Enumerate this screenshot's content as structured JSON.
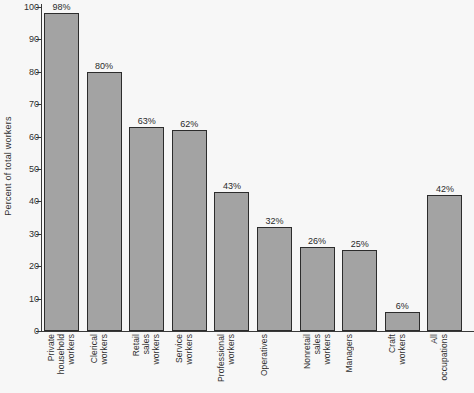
{
  "chart_data": {
    "type": "bar",
    "title": "",
    "xlabel": "",
    "ylabel": "Percent of total workers",
    "ylim": [
      0,
      100
    ],
    "ytick_step": 10,
    "yticks": [
      0,
      10,
      20,
      30,
      40,
      50,
      60,
      70,
      80,
      90,
      100
    ],
    "grid": false,
    "legend": null,
    "bar_color": "#a3a3a3",
    "bar_edge_color": "#2c2c2c",
    "background_color": "#f7f7f7",
    "value_suffix": "%",
    "categories": [
      "Private household workers",
      "Clerical workers",
      "Retail sales workers",
      "Service workers",
      "Professional workers",
      "Operatives",
      "Nonretail sales workers",
      "Managers",
      "Craft workers",
      "All occupations"
    ],
    "category_lines": [
      [
        "Private",
        "household",
        "workers"
      ],
      [
        "Clerical",
        "workers"
      ],
      [
        "Retail",
        "sales",
        "workers"
      ],
      [
        "Service",
        "workers"
      ],
      [
        "Professional",
        "workers"
      ],
      [
        "Operatives"
      ],
      [
        "Nonretail",
        "sales",
        "workers"
      ],
      [
        "Managers"
      ],
      [
        "Craft",
        "workers"
      ],
      [
        "All",
        "occupations"
      ]
    ],
    "values": [
      98,
      80,
      63,
      62,
      43,
      32,
      26,
      25,
      6,
      42
    ],
    "value_labels": [
      "98%",
      "80%",
      "63%",
      "62%",
      "43%",
      "32%",
      "26%",
      "25%",
      "6%",
      "42%"
    ],
    "ytick_labels": [
      "0",
      "10",
      "20",
      "30",
      "40",
      "50",
      "60",
      "70",
      "80",
      "90",
      "100"
    ]
  }
}
